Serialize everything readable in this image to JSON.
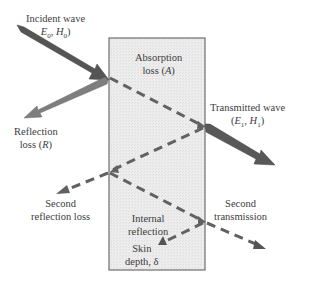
{
  "diagram": {
    "type": "electromagnetic-shielding",
    "colors": {
      "shield_fill": "#ececec",
      "shield_border": "#6e6e6e",
      "incident_arrow": "#555555",
      "reflection_arrow": "#7e7e7e",
      "transmitted_arrow": "#585858",
      "dashed_lines": "#616161"
    },
    "labels": {
      "incident_line1": "Incident wave",
      "incident_line2": "(E0, H0)",
      "absorption_line1": "Absorption",
      "absorption_line2": "loss (A)",
      "transmitted_line1": "Transmitted wave",
      "transmitted_line2": "(E1, H1)",
      "reflection_line1": "Reflection",
      "reflection_line2": "loss (R)",
      "second_reflection_line1": "Second",
      "second_reflection_line2": "reflection loss",
      "second_transmission_line1": "Second",
      "second_transmission_line2": "transmission",
      "internal_reflection_line1": "Internal",
      "internal_reflection_line2": "reflection",
      "skin_depth_line1": "Skin",
      "skin_depth_line2": "depth, δ"
    }
  }
}
